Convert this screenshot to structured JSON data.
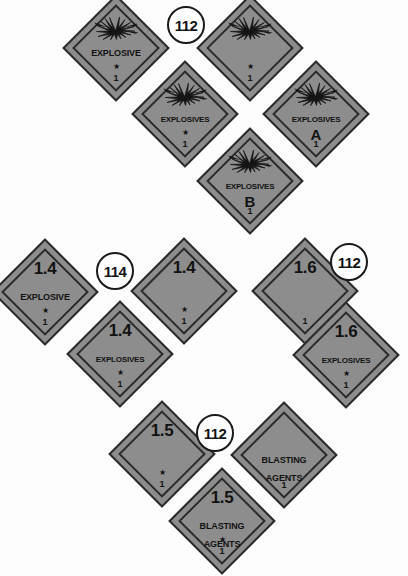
{
  "page": {
    "background_color": "#fdfdfd",
    "placard_fill_color": "#8d8d8d",
    "placard_border_color": "#2a2a2a",
    "text_color": "#121212"
  },
  "star_glyph": "★",
  "placards": [
    {
      "id": "explosive-generic",
      "top_text": "",
      "mid_text": "EXPLOSIVE",
      "bottom_text": "",
      "class_number": "1",
      "has_star": true,
      "has_burst": true,
      "x": 72,
      "y": 4
    },
    {
      "id": "explosive-blank",
      "top_text": "",
      "mid_text": "",
      "bottom_text": "",
      "class_number": "1",
      "has_star": true,
      "has_burst": true,
      "x": 206,
      "y": 4
    },
    {
      "id": "explosives-generic",
      "top_text": "",
      "mid_text": "EXPLOSIVES",
      "bottom_text": "",
      "class_number": "1",
      "has_star": true,
      "has_burst": true,
      "x": 141,
      "y": 70
    },
    {
      "id": "explosives-a",
      "top_text": "",
      "mid_text": "EXPLOSIVES",
      "bottom_text": "A",
      "class_number": "1",
      "has_star": false,
      "has_burst": true,
      "x": 272,
      "y": 70
    },
    {
      "id": "explosives-b",
      "top_text": "",
      "mid_text": "EXPLOSIVES",
      "bottom_text": "B",
      "class_number": "1",
      "has_star": false,
      "has_burst": true,
      "x": 206,
      "y": 137
    },
    {
      "id": "div-1-4-explosive",
      "top_text": "1.4",
      "mid_text": "EXPLOSIVE",
      "bottom_text": "",
      "class_number": "1",
      "has_star": true,
      "has_burst": false,
      "x": 1,
      "y": 248
    },
    {
      "id": "div-1-4-blank",
      "top_text": "1.4",
      "mid_text": "",
      "bottom_text": "",
      "class_number": "1",
      "has_star": true,
      "has_burst": false,
      "x": 140,
      "y": 247
    },
    {
      "id": "div-1-6-blank",
      "top_text": "1.6",
      "mid_text": "",
      "bottom_text": "",
      "class_number": "1",
      "has_star": false,
      "has_burst": false,
      "x": 261,
      "y": 247
    },
    {
      "id": "div-1-4-explosives",
      "top_text": "1.4",
      "mid_text": "EXPLOSIVES",
      "bottom_text": "",
      "class_number": "1",
      "has_star": true,
      "has_burst": false,
      "x": 76,
      "y": 310
    },
    {
      "id": "div-1-6-explosives",
      "top_text": "1.6",
      "mid_text": "EXPLOSIVES",
      "bottom_text": "",
      "class_number": "1",
      "has_star": true,
      "has_burst": false,
      "x": 302,
      "y": 311
    },
    {
      "id": "div-1-5-blank",
      "top_text": "1.5",
      "mid_text": "",
      "bottom_text": "",
      "class_number": "1",
      "has_star": true,
      "has_burst": false,
      "x": 118,
      "y": 410
    },
    {
      "id": "blasting-agents",
      "top_text": "",
      "mid_text": "BLASTING",
      "bottom_text": "AGENTS",
      "class_number": "1",
      "has_star": false,
      "has_burst": false,
      "x": 240,
      "y": 411
    },
    {
      "id": "div-1-5-blasting-agents",
      "top_text": "1.5",
      "mid_text": "BLASTING",
      "bottom_text": "AGENTS",
      "class_number": "1",
      "has_star": true,
      "has_burst": false,
      "x": 178,
      "y": 477
    }
  ],
  "code_circles": [
    {
      "id": "code-112-top",
      "label": "112",
      "x": 167,
      "y": 6
    },
    {
      "id": "code-114-mid-left",
      "label": "114",
      "x": 96,
      "y": 252
    },
    {
      "id": "code-112-mid-right",
      "label": "112",
      "x": 330,
      "y": 243
    },
    {
      "id": "code-112-bottom",
      "label": "112",
      "x": 196,
      "y": 414
    }
  ]
}
